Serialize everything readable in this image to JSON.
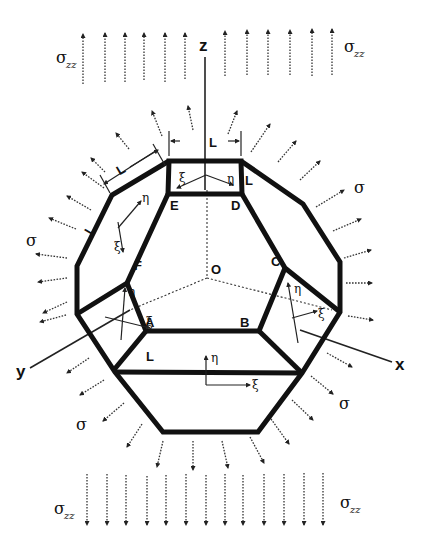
{
  "diagram": {
    "axes": {
      "z": "z",
      "x": "x",
      "y": "y",
      "origin": "O"
    },
    "vertices": {
      "A": "A",
      "B": "B",
      "C": "C",
      "D": "D",
      "E": "E",
      "F": "F"
    },
    "dimension_label": "L",
    "local_axes": {
      "xi": "ξ",
      "eta": "η"
    },
    "stress": {
      "zz_symbol": "σ",
      "zz_subscript": "zz",
      "lateral_symbol": "σ"
    }
  }
}
